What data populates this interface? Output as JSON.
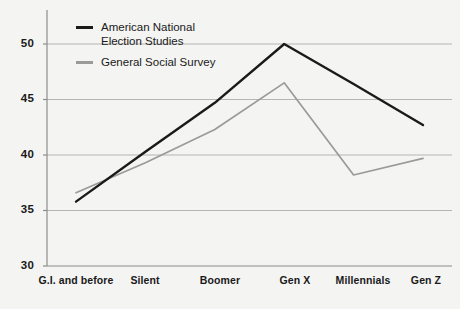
{
  "chart_data": {
    "type": "line",
    "title": "",
    "xlabel": "",
    "ylabel": "",
    "categories": [
      "G.I. and\nbefore",
      "Silent",
      "Boomer",
      "Gen X",
      "Millennials",
      "Gen Z"
    ],
    "ylim": [
      30,
      51
    ],
    "yticks": [
      30,
      35,
      40,
      45,
      50
    ],
    "ytick_labels": [
      "30",
      "35",
      "40",
      "45",
      "50"
    ],
    "grid": "horizontal",
    "legend_position": "top-left",
    "series": [
      {
        "name": "American National\nElection Studies",
        "color": "#1a1a1a",
        "values": [
          35.8,
          40.3,
          44.7,
          50.0,
          46.4,
          42.7
        ]
      },
      {
        "name": "General Social Survey",
        "color": "#9a9a9a",
        "values": [
          36.6,
          39.3,
          42.3,
          46.5,
          38.2,
          39.7
        ]
      }
    ]
  },
  "legend": {
    "items": [
      {
        "label": "American National\nElection Studies",
        "color": "#1a1a1a"
      },
      {
        "label": "General Social Survey",
        "color": "#9a9a9a"
      }
    ]
  },
  "axes": {
    "y_labels": [
      "50",
      "45",
      "40",
      "35",
      "30"
    ],
    "x_labels": [
      "G.I. and\nbefore",
      "Silent",
      "Boomer",
      "Gen X",
      "Millennials",
      "Gen Z"
    ]
  },
  "colors": {
    "background": "#f4f4f2",
    "axis": "#8c8c8c",
    "grid": "#b5b5b3",
    "series_primary": "#1a1a1a",
    "series_secondary": "#9a9a9a",
    "text": "#1a1a1a"
  }
}
